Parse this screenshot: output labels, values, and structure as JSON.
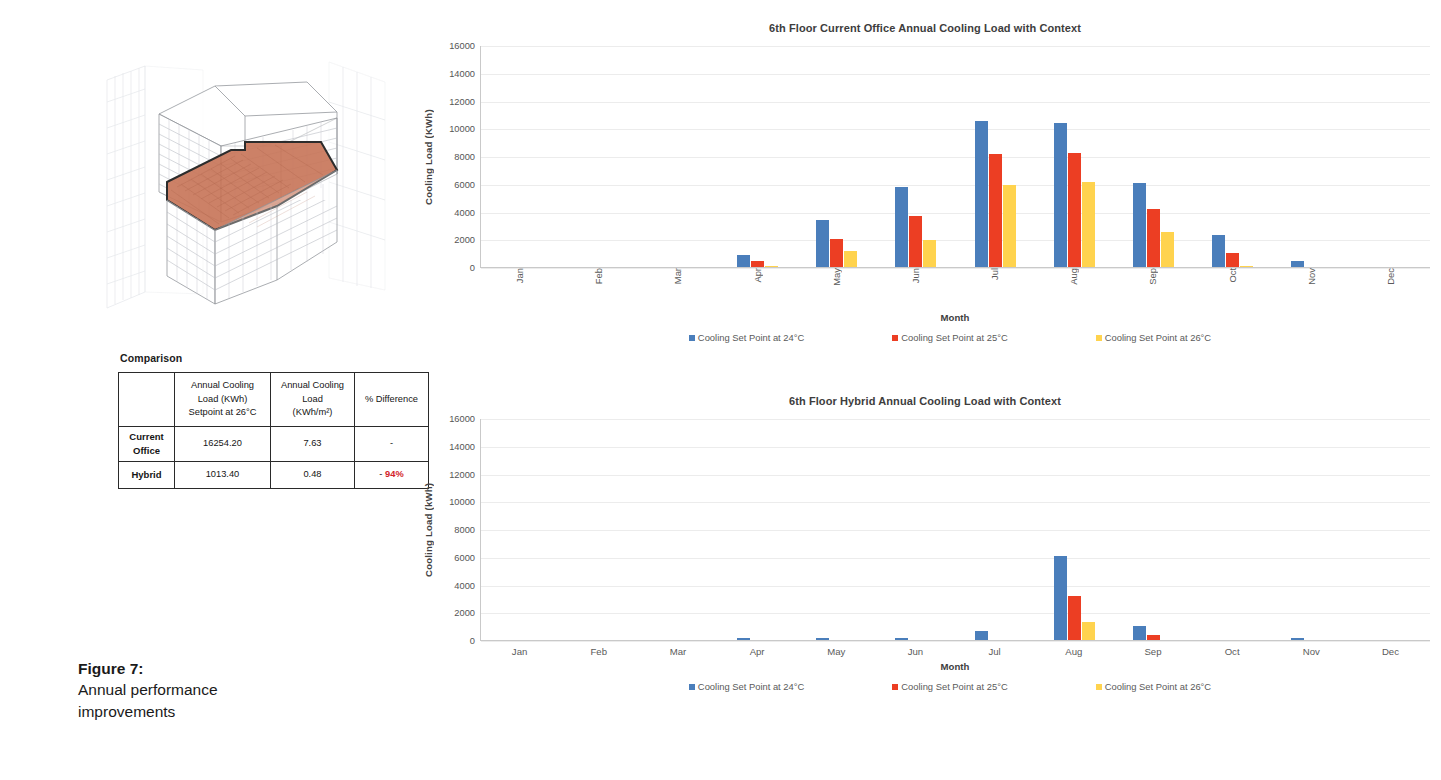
{
  "figure": {
    "number": "Figure 7:",
    "caption_line1": "Annual performance",
    "caption_line2": "improvements"
  },
  "building": {
    "alt": "3D wireframe massing model of an office tower with the 6th floor plate highlighted in orange",
    "highlight_color": "#C8765A",
    "wireframe_color": "#b9bcc2"
  },
  "comparison": {
    "heading": "Comparison",
    "columns": [
      "",
      "Annual Cooling Load (KWh) Setpoint at 26°C",
      "Annual Cooling Load (KWh/m²)",
      "% Difference"
    ],
    "col1_line1": "Annual Cooling",
    "col1_line2": "Load (KWh)",
    "col1_line3": "Setpoint at 26°C",
    "col2_line1": "Annual Cooling",
    "col2_line2": "Load",
    "col2_line3": "(KWh/m²)",
    "col3_line1": "% Difference",
    "rows": [
      {
        "label_line1": "Current",
        "label_line2": "Office",
        "annual_load_kwh": "16254.20",
        "annual_load_kwh_m2": "7.63",
        "pct_difference": "-"
      },
      {
        "label_line1": "Hybrid",
        "label_line2": "",
        "annual_load_kwh": "1013.40",
        "annual_load_kwh_m2": "0.48",
        "pct_difference_dash": "-",
        "pct_difference_value": "94%"
      }
    ]
  },
  "colors": {
    "series_24": "#4A7EBB",
    "series_25": "#EC3E23",
    "series_26": "#FFD34E",
    "negative": "#d3232a",
    "gridline": "#ececec"
  },
  "chart_data": [
    {
      "id": "current-office",
      "type": "bar",
      "title": "6th Floor Current Office Annual Cooling Load with Context",
      "xlabel": "Month",
      "ylabel": "Cooling Load (KWh)",
      "categories": [
        "Jan",
        "Feb",
        "Mar",
        "Apr",
        "May",
        "Jun",
        "Jul",
        "Aug",
        "Sep",
        "Oct",
        "Nov",
        "Dec"
      ],
      "ylim": [
        0,
        16000
      ],
      "yticks": [
        0,
        2000,
        4000,
        6000,
        8000,
        10000,
        12000,
        14000,
        16000
      ],
      "grid": true,
      "legend_position": "bottom",
      "xtick_rotation": 90,
      "series": [
        {
          "name": "Cooling Set Point at 24°C",
          "color": "#4A7EBB",
          "values": [
            0,
            0,
            0,
            850,
            3400,
            5750,
            10550,
            10400,
            6050,
            2300,
            450,
            0
          ]
        },
        {
          "name": "Cooling Set Point at 25°C",
          "color": "#EC3E23",
          "values": [
            0,
            0,
            0,
            400,
            2050,
            3700,
            8150,
            8250,
            4200,
            1000,
            0,
            0
          ]
        },
        {
          "name": "Cooling Set Point at 26°C",
          "color": "#FFD34E",
          "values": [
            0,
            0,
            0,
            70,
            1150,
            1950,
            5900,
            6100,
            2550,
            100,
            0,
            0
          ]
        }
      ]
    },
    {
      "id": "hybrid",
      "type": "bar",
      "title": "6th Floor Hybrid Annual Cooling Load with Context",
      "xlabel": "Month",
      "ylabel": "Cooling Load (kWh)",
      "categories": [
        "Jan",
        "Feb",
        "Mar",
        "Apr",
        "May",
        "Jun",
        "Jul",
        "Aug",
        "Sep",
        "Oct",
        "Nov",
        "Dec"
      ],
      "ylim": [
        0,
        16000
      ],
      "yticks": [
        0,
        2000,
        4000,
        6000,
        8000,
        10000,
        12000,
        14000,
        16000
      ],
      "grid": true,
      "legend_position": "bottom",
      "xtick_rotation": 0,
      "series": [
        {
          "name": "Cooling Set Point at 24°C",
          "color": "#4A7EBB",
          "values": [
            0,
            0,
            0,
            180,
            170,
            180,
            680,
            6050,
            1000,
            0,
            130,
            0
          ]
        },
        {
          "name": "Cooling Set Point at 25°C",
          "color": "#EC3E23",
          "values": [
            0,
            0,
            0,
            0,
            0,
            0,
            0,
            3150,
            330,
            0,
            0,
            0
          ]
        },
        {
          "name": "Cooling Set Point at 26°C",
          "color": "#FFD34E",
          "values": [
            0,
            0,
            0,
            0,
            0,
            0,
            0,
            1300,
            0,
            0,
            0,
            0
          ]
        }
      ]
    }
  ]
}
